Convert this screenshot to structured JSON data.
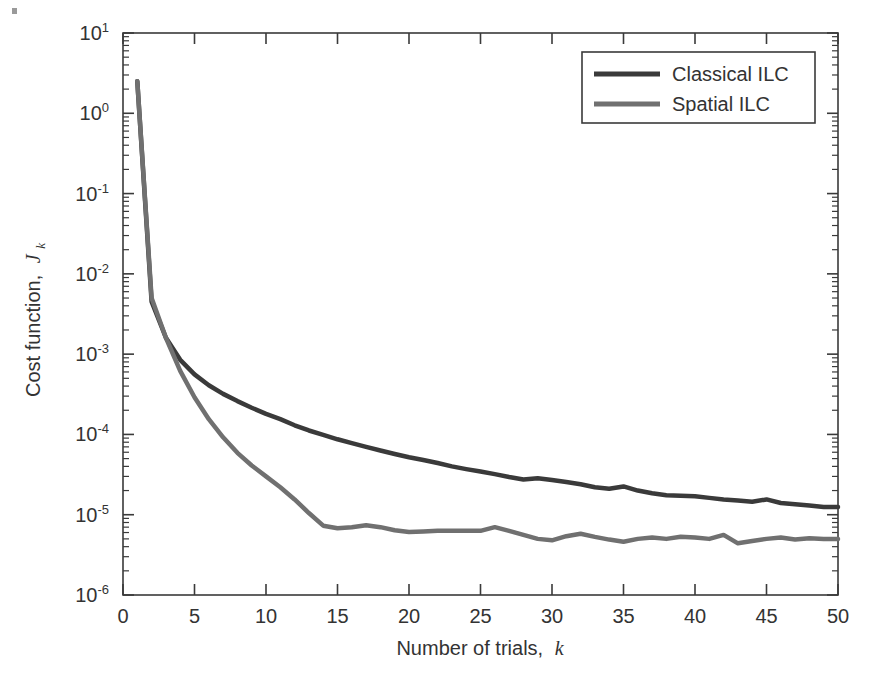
{
  "chart_data": {
    "type": "line",
    "title": "",
    "xlabel": "Number of trials, k",
    "xlabel_main": "Number of trials,",
    "xlabel_italic": "k",
    "ylabel": "Cost function, J_k",
    "ylabel_main": "Cost function,",
    "ylabel_italic": "J",
    "ylabel_sub": "k",
    "yscale": "log",
    "xscale": "linear",
    "xlim": [
      0,
      50
    ],
    "ylim": [
      1e-06,
      10
    ],
    "grid": false,
    "legend_position": "top-right",
    "xticks": [
      0,
      5,
      10,
      15,
      20,
      25,
      30,
      35,
      40,
      45,
      50
    ],
    "xtick_labels": [
      "0",
      "5",
      "10",
      "15",
      "20",
      "25",
      "30",
      "35",
      "40",
      "45",
      "50"
    ],
    "yticks": [
      1e-06,
      1e-05,
      0.0001,
      0.001,
      0.01,
      0.1,
      1,
      10
    ],
    "ytick_labels": [
      "10-6",
      "10-5",
      "10-4",
      "10-3",
      "10-2",
      "10-1",
      "100",
      "101"
    ],
    "ytick_mantissa": "10",
    "ytick_exponents": [
      "-6",
      "-5",
      "-4",
      "-3",
      "-2",
      "-1",
      "0",
      "1"
    ],
    "x": [
      1,
      2,
      3,
      4,
      5,
      6,
      7,
      8,
      9,
      10,
      11,
      12,
      13,
      14,
      15,
      16,
      17,
      18,
      19,
      20,
      21,
      22,
      23,
      24,
      25,
      26,
      27,
      28,
      29,
      30,
      31,
      32,
      33,
      34,
      35,
      36,
      37,
      38,
      39,
      40,
      41,
      42,
      43,
      44,
      45,
      46,
      47,
      48,
      49,
      50
    ],
    "series": [
      {
        "name": "Classical ILC",
        "color": "#3a3a3a",
        "width": 4.5,
        "values": [
          2.5,
          0.0045,
          0.0016,
          0.00085,
          0.00056,
          0.00041,
          0.00032,
          0.00026,
          0.000215,
          0.00018,
          0.000155,
          0.00013,
          0.000112,
          9.9e-05,
          8.7e-05,
          7.8e-05,
          7e-05,
          6.3e-05,
          5.7e-05,
          5.2e-05,
          4.8e-05,
          4.4e-05,
          4e-05,
          3.7e-05,
          3.45e-05,
          3.2e-05,
          2.95e-05,
          2.75e-05,
          2.85e-05,
          2.7e-05,
          2.55e-05,
          2.4e-05,
          2.2e-05,
          2.1e-05,
          2.25e-05,
          2e-05,
          1.85e-05,
          1.75e-05,
          1.72e-05,
          1.7e-05,
          1.62e-05,
          1.55e-05,
          1.5e-05,
          1.45e-05,
          1.55e-05,
          1.4e-05,
          1.35e-05,
          1.3e-05,
          1.25e-05,
          1.25e-05
        ]
      },
      {
        "name": "Spatial ILC",
        "color": "#707070",
        "width": 4.5,
        "values": [
          2.5,
          0.005,
          0.0016,
          0.00062,
          0.00029,
          0.000155,
          9.2e-05,
          5.9e-05,
          4.1e-05,
          3e-05,
          2.2e-05,
          1.55e-05,
          1.05e-05,
          7.3e-06,
          6.8e-06,
          7e-06,
          7.4e-06,
          7e-06,
          6.4e-06,
          6.1e-06,
          6.2e-06,
          6.3e-06,
          6.3e-06,
          6.3e-06,
          6.3e-06,
          7e-06,
          6.3e-06,
          5.6e-06,
          5e-06,
          4.8e-06,
          5.4e-06,
          5.8e-06,
          5.3e-06,
          4.9e-06,
          4.6e-06,
          5e-06,
          5.2e-06,
          5e-06,
          5.3e-06,
          5.2e-06,
          5e-06,
          5.6e-06,
          4.4e-06,
          4.7e-06,
          5e-06,
          5.2e-06,
          4.9e-06,
          5.1e-06,
          5e-06,
          5e-06
        ]
      }
    ],
    "legend": [
      {
        "label": "Classical ILC",
        "color": "#3a3a3a"
      },
      {
        "label": "Spatial ILC",
        "color": "#707070"
      }
    ]
  }
}
